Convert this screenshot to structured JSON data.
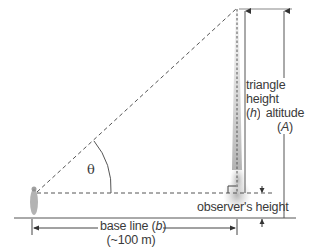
{
  "diagram": {
    "angle_label": "θ",
    "labels": {
      "triangle_height_line1": "triangle",
      "triangle_height_line2": "height",
      "triangle_height_symbol_open": "(",
      "triangle_height_symbol": "h",
      "triangle_height_symbol_close": ")",
      "altitude_line1": "altitude",
      "altitude_symbol_open": "(",
      "altitude_symbol": "A",
      "altitude_symbol_close": ")",
      "observer_height": "observer's height",
      "base_line_text": "base line (",
      "base_line_symbol": "b",
      "base_line_close": ")",
      "base_line_distance": "(~100 m)"
    },
    "colors": {
      "line": "#555555",
      "dashed": "#555555",
      "smoke": "#b8b8b8",
      "text": "#3a3a3a"
    }
  }
}
